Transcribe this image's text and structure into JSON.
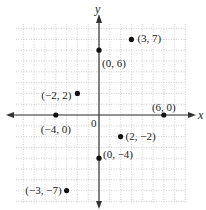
{
  "chart_data": {
    "type": "scatter",
    "title": "",
    "xlabel": "x",
    "ylabel": "y",
    "origin_label": "0",
    "xlim": [
      -8,
      8
    ],
    "ylim": [
      -8,
      8
    ],
    "grid": true,
    "points": [
      {
        "x": 3,
        "y": 7,
        "label": "(3, 7)"
      },
      {
        "x": 0,
        "y": 6,
        "label": "(0, 6)"
      },
      {
        "x": -2,
        "y": 2,
        "label": "(−2, 2)"
      },
      {
        "x": 6,
        "y": 0,
        "label": "(6, 0)"
      },
      {
        "x": -4,
        "y": 0,
        "label": "(−4, 0)"
      },
      {
        "x": 2,
        "y": -2,
        "label": "(2, −2)"
      },
      {
        "x": 0,
        "y": -4,
        "label": "(0, −4)"
      },
      {
        "x": -3,
        "y": -7,
        "label": "(−3, −7)"
      }
    ],
    "colors": {
      "point": "#111111",
      "axis": "#333333",
      "grid": "#b0b0b0"
    }
  }
}
